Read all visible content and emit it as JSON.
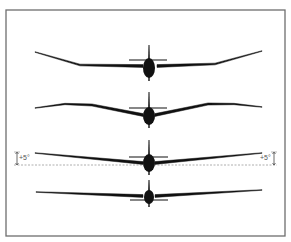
{
  "figure": {
    "frame": {
      "x": 6,
      "y": 10,
      "width": 279,
      "height": 226,
      "color": "#6e6e6e"
    },
    "ink_color": "#111111",
    "reference_line_color": "#9a9a9a"
  },
  "gliders": [
    {
      "id": "polyhedral-outer-dihedral",
      "wing_left": [
        [
          35,
          52
        ],
        [
          80,
          65
        ],
        [
          143,
          66
        ]
      ],
      "wing_right": [
        [
          157,
          66
        ],
        [
          215,
          64
        ],
        [
          262,
          51
        ]
      ],
      "fin": {
        "x": 149,
        "top": 45,
        "bottom": 62
      },
      "tailplane": {
        "y": 60,
        "x1": 129,
        "x2": 167,
        "above_wing": true
      },
      "body": {
        "cx": 149,
        "cy": 68,
        "rx": 6,
        "ry": 10
      }
    },
    {
      "id": "gull-wing",
      "wing_left": [
        [
          35,
          108
        ],
        [
          65,
          104
        ],
        [
          92,
          105
        ],
        [
          143,
          115
        ]
      ],
      "wing_right": [
        [
          155,
          115
        ],
        [
          208,
          104
        ],
        [
          234,
          104
        ],
        [
          262,
          107
        ]
      ],
      "fin": {
        "x": 149,
        "top": 92,
        "bottom": 110
      },
      "tailplane": {
        "y": 108,
        "x1": 129,
        "x2": 167,
        "above_wing": true
      },
      "body": {
        "cx": 149,
        "cy": 116,
        "rx": 6,
        "ry": 9
      }
    },
    {
      "id": "straight-dihedral-5deg",
      "wing_left": [
        [
          35,
          153
        ],
        [
          143,
          163
        ]
      ],
      "wing_right": [
        [
          155,
          163
        ],
        [
          262,
          153
        ]
      ],
      "fin": {
        "x": 149,
        "top": 140,
        "bottom": 158
      },
      "tailplane": {
        "y": 157,
        "x1": 129,
        "x2": 168,
        "above_wing": true
      },
      "body": {
        "cx": 149,
        "cy": 163,
        "rx": 6,
        "ry": 9
      }
    },
    {
      "id": "flat-wing",
      "wing_left": [
        [
          36,
          192
        ],
        [
          143,
          196
        ]
      ],
      "wing_right": [
        [
          155,
          196
        ],
        [
          262,
          190
        ]
      ],
      "fin": {
        "x": 149,
        "top": 180,
        "bottom": 192
      },
      "tailplane": {
        "y": 200,
        "x1": 130,
        "x2": 168,
        "above_wing": false
      },
      "body": {
        "cx": 149,
        "cy": 197,
        "rx": 5,
        "ry": 7
      }
    }
  ],
  "annotations": {
    "reference_line_y": 165,
    "left_angle": {
      "label": "+5°",
      "x": 19,
      "y": 160,
      "bracket_x": 17,
      "y_top": 152,
      "y_bottom": 165
    },
    "right_angle": {
      "label": "+5°",
      "x": 260,
      "y": 160,
      "bracket_x": 274,
      "y_top": 152,
      "y_bottom": 165
    }
  }
}
